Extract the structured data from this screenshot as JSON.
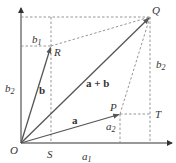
{
  "diagram": {
    "colors": {
      "line": "#555555",
      "dashed": "#888888",
      "text": "#333333"
    },
    "points": {
      "O": {
        "label": "O",
        "x": 21,
        "y": 143
      },
      "S": {
        "label": "S",
        "x": 51,
        "y": 143
      },
      "R": {
        "label": "R",
        "x": 51,
        "y": 46
      },
      "P": {
        "label": "P",
        "x": 120,
        "y": 114
      },
      "T": {
        "label": "T",
        "x": 150,
        "y": 114
      },
      "Q": {
        "label": "Q",
        "x": 150,
        "y": 17
      }
    },
    "vectors": [
      {
        "name": "a",
        "label": "a",
        "from": "O",
        "to": "P"
      },
      {
        "name": "b",
        "label": "b",
        "from": "O",
        "to": "R"
      },
      {
        "name": "a+b",
        "label": "a + b",
        "from": "O",
        "to": "Q"
      }
    ],
    "labels": {
      "O": "O",
      "S": "S",
      "R": "R",
      "P": "P",
      "T": "T",
      "Q": "Q",
      "a": "a",
      "b": "b",
      "a_plus_b": "a + b",
      "a1_main": "a",
      "a1_sub": "1",
      "a2_main": "a",
      "a2_sub": "2",
      "b1_main": "b",
      "b1_sub": "1",
      "b2_left_main": "b",
      "b2_left_sub": "2",
      "b2_right_main": "b",
      "b2_right_sub": "2"
    }
  }
}
